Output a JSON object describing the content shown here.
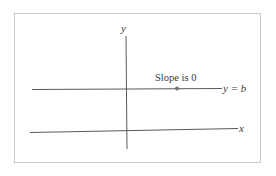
{
  "diagram": {
    "axes": {
      "x_label": "x",
      "y_label": "y"
    },
    "line": {
      "equation_label": "y = b",
      "annotation": "Slope is 0"
    },
    "colors": {
      "line": "#5a5a5a",
      "frame": "#c8c8c8",
      "dot": "#707070",
      "text": "#3a3a3a"
    }
  }
}
